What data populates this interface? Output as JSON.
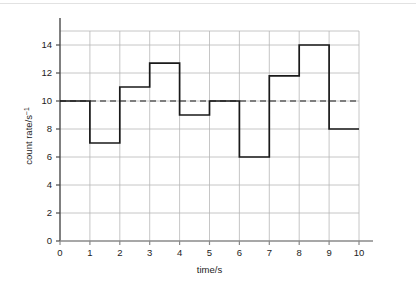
{
  "figure": {
    "background_color": "#ffffff",
    "top_rule_color": "#e2e2e2"
  },
  "chart_data": {
    "type": "line",
    "subtype": "step",
    "title": "",
    "subtitle": "",
    "xlabel": "time/s",
    "ylabel_text": "count rate/s",
    "ylabel_superscript": "−1",
    "ylabel": "count rate/s⁻¹",
    "xlim": [
      0,
      10
    ],
    "ylim": [
      0,
      15
    ],
    "x_ticks": [
      0,
      1,
      2,
      3,
      4,
      5,
      6,
      7,
      8,
      9,
      10
    ],
    "x_tick_labels": [
      "0",
      "1",
      "2",
      "3",
      "4",
      "5",
      "6",
      "7",
      "8",
      "9",
      "10"
    ],
    "y_ticks": [
      0,
      2,
      4,
      6,
      8,
      10,
      12,
      14
    ],
    "y_tick_labels": [
      "0",
      "2",
      "4",
      "6",
      "8",
      "10",
      "12",
      "14"
    ],
    "grid": true,
    "grid_color": "#b8b8b8",
    "legend": false,
    "legend_position": "none",
    "series": [
      {
        "name": "count rate",
        "style": "step-post",
        "color": "#1a1a1a",
        "line_width": 1.7,
        "x_intervals": [
          [
            0,
            1
          ],
          [
            1,
            2
          ],
          [
            2,
            3
          ],
          [
            3,
            4
          ],
          [
            4,
            5
          ],
          [
            5,
            6
          ],
          [
            6,
            7
          ],
          [
            7,
            8
          ],
          [
            8,
            9
          ],
          [
            9,
            10
          ]
        ],
        "values": [
          10,
          7,
          11,
          12.7,
          9,
          10,
          6,
          11.8,
          14,
          8
        ]
      }
    ],
    "reference_lines": [
      {
        "name": "mean count rate",
        "orientation": "horizontal",
        "value": 10,
        "style": "dashed",
        "color": "#1a1a1a",
        "line_width": 1.1
      }
    ],
    "annotations": []
  },
  "geometry": {
    "plot_left": 60,
    "plot_right": 359,
    "plot_top": 31,
    "plot_bottom": 241
  }
}
